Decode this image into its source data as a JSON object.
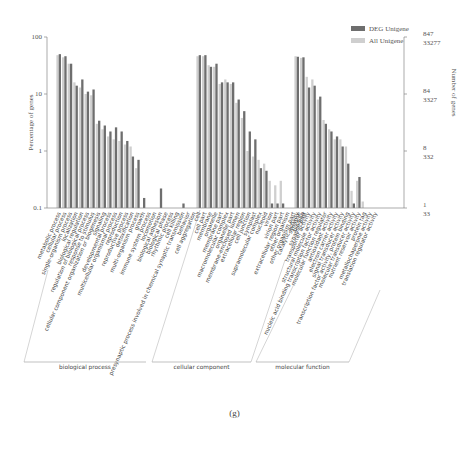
{
  "chart_data": {
    "type": "bar",
    "title": "",
    "ylabel": "Percentage of genes",
    "y2label": "Number of genes",
    "yscale": "log",
    "ylim": [
      0.1,
      100
    ],
    "y_ticks": [
      "100",
      "10",
      "1",
      "0.1"
    ],
    "y2_ticks": [
      {
        "top": "847",
        "bottom": "33277"
      },
      {
        "top": "84",
        "bottom": "3327"
      },
      {
        "top": "8",
        "bottom": "332"
      },
      {
        "top": "1",
        "bottom": "33"
      }
    ],
    "legend": [
      "DEG Unigene",
      "All Unigene"
    ],
    "legend_position": "top-right",
    "grid": false,
    "groups": [
      {
        "name": "biological process",
        "categories": [
          "metabolic process",
          "cellular process",
          "single-organism process",
          "localization",
          "biological regulation",
          "regulation of biological process",
          "response to stimulus",
          "cellular component organization or biogenesis",
          "signaling",
          "developmental process",
          "multicellular organismal process",
          "reproduction",
          "reproductive process",
          "detoxification",
          "multi-organism process",
          "growth",
          "immune system process",
          "locomotion",
          "biological adhesion",
          "biological phase",
          "rhythmic process",
          "cell killing",
          "presynaptic process involved in chemical synaptic transmission",
          "behavior",
          "cell aggregation"
        ]
      },
      {
        "name": "cellular component",
        "categories": [
          "cell",
          "cell part",
          "membrane",
          "organelle",
          "membrane part",
          "macromolecular complex",
          "organelle part",
          "membrane-enclosed lumen",
          "extracellular region",
          "cell junction",
          "symplast",
          "supramolecular complex",
          "nucleoid",
          "virion",
          "virion part",
          "extracellular region part",
          "other organism",
          "other organism part",
          "synapse",
          "synapse part"
        ]
      },
      {
        "name": "molecular function",
        "categories": [
          "catalytic activity",
          "binding",
          "transporter activity",
          "structural molecule activity",
          "nucleic acid binding transcription factor activity",
          "molecular function regulator",
          "antioxidant activity",
          "electron carrier activity",
          "signal transducer activity",
          "transcription factor activity, protein binding",
          "molecular transducer activity",
          "nutrient reservoir activity",
          "protein tag",
          "metallochaperone activity",
          "translation regulator activity"
        ]
      }
    ],
    "categories": [
      "metabolic process",
      "cellular process",
      "single-organism process",
      "localization",
      "biological regulation",
      "regulation of biological process",
      "response to stimulus",
      "cellular component organization or biogenesis",
      "signaling",
      "developmental process",
      "multicellular organismal process",
      "reproduction",
      "reproductive process",
      "detoxification",
      "multi-organism process",
      "growth",
      "immune system process",
      "locomotion",
      "biological adhesion",
      "biological phase",
      "rhythmic process",
      "cell killing",
      "presynaptic process involved in chemical synaptic transmission",
      "behavior",
      "cell aggregation",
      "cell",
      "cell part",
      "membrane",
      "organelle",
      "membrane part",
      "macromolecular complex",
      "organelle part",
      "membrane-enclosed lumen",
      "extracellular region",
      "cell junction",
      "symplast",
      "supramolecular complex",
      "nucleoid",
      "virion",
      "virion part",
      "extracellular region part",
      "other organism",
      "other organism part",
      "synapse",
      "synapse part",
      "catalytic activity",
      "binding",
      "transporter activity",
      "structural molecule activity",
      "nucleic acid binding transcription factor activity",
      "molecular function regulator",
      "antioxidant activity",
      "electron carrier activity",
      "signal transducer activity",
      "transcription factor activity, protein binding",
      "molecular transducer activity",
      "nutrient reservoir activity",
      "protein tag",
      "metallochaperone activity",
      "translation regulator activity"
    ],
    "series": [
      {
        "name": "DEG Unigene",
        "color": "#6e6e6e",
        "values": [
          50,
          46,
          34,
          14,
          18,
          11,
          12,
          3.4,
          2.8,
          2.2,
          2.6,
          2.2,
          1.5,
          0.8,
          0.7,
          0.15,
          0.1,
          0.1,
          0.22,
          0.1,
          0.1,
          0.1,
          0.12,
          0.1,
          0.1,
          48,
          48,
          30,
          34,
          16,
          16,
          16,
          8,
          5,
          2.2,
          1.6,
          0.5,
          0.45,
          0.12,
          0.12,
          0.12,
          0.1,
          0.1,
          0.1,
          0.1,
          45,
          44,
          13,
          14,
          9,
          3,
          2.2,
          1.8,
          1.2,
          0.6,
          0.12,
          0.35,
          0.1,
          0.1,
          0.1
        ]
      },
      {
        "name": "All Unigene",
        "color": "#cfcfcf",
        "values": [
          48,
          44,
          34,
          16,
          13,
          10,
          9.5,
          3.0,
          2.4,
          1.8,
          1.6,
          1.5,
          1.3,
          1.2,
          0.5,
          0.1,
          0.1,
          0.1,
          0.1,
          0.1,
          0.1,
          0.1,
          0.1,
          0.1,
          0.1,
          46,
          46,
          32,
          30,
          15,
          18,
          15,
          7,
          3.8,
          1.0,
          0.8,
          0.7,
          0.6,
          0.3,
          0.25,
          0.3,
          0.1,
          0.1,
          0.13,
          0.1,
          46,
          43,
          20,
          18,
          8,
          3.5,
          2.4,
          1.6,
          1.6,
          1.2,
          0.2,
          0.3,
          0.13,
          0.1,
          0.1
        ]
      }
    ]
  },
  "caption": "(g)"
}
